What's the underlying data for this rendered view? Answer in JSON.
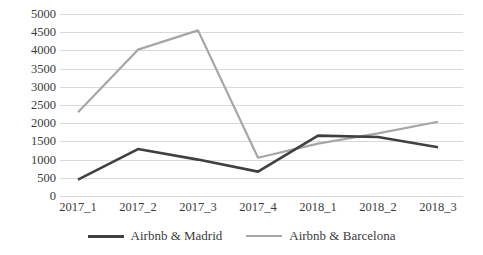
{
  "chart_data": {
    "type": "line",
    "title": "",
    "xlabel": "",
    "ylabel": "",
    "categories": [
      "2017_1",
      "2017_2",
      "2017_3",
      "2017_4",
      "2018_1",
      "2018_2",
      "2018_3"
    ],
    "series": [
      {
        "name": "Airbnb & Madrid",
        "color": "#404040",
        "values": [
          450,
          1290,
          1000,
          670,
          1660,
          1620,
          1340
        ]
      },
      {
        "name": "Airbnb & Barcelona",
        "color": "#a6a6a6",
        "values": [
          2300,
          4020,
          4550,
          1050,
          1440,
          1720,
          2040
        ]
      }
    ],
    "ylim": [
      0,
      5000
    ],
    "ytick_labels": [
      "0",
      "500",
      "1000",
      "1500",
      "2000",
      "2500",
      "3000",
      "3500",
      "4000",
      "4500",
      "5000"
    ],
    "ytick_values": [
      0,
      500,
      1000,
      1500,
      2000,
      2500,
      3000,
      3500,
      4000,
      4500,
      5000
    ],
    "grid": true,
    "legend_position": "bottom",
    "gridline_color": "#d9d9d9"
  }
}
